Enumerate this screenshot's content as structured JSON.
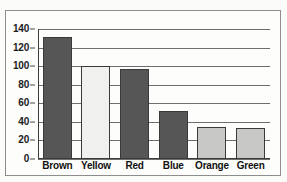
{
  "chart_data": {
    "type": "bar",
    "title": "",
    "subtitle": "",
    "xlabel": "",
    "ylabel": "",
    "categories": [
      "Brown",
      "Yellow",
      "Red",
      "Blue",
      "Orange",
      "Green"
    ],
    "values": [
      131,
      100,
      97,
      52,
      35,
      33
    ],
    "ylim": [
      0,
      140
    ],
    "yticks": [
      0,
      20,
      40,
      60,
      80,
      100,
      120,
      140
    ],
    "ytick_labels": [
      "0",
      "20",
      "40",
      "60",
      "80",
      "100",
      "120",
      "140"
    ],
    "grid": true,
    "legend": false,
    "legend_position": "none",
    "bar_colors": [
      "#565656",
      "#f0f0ee",
      "#565656",
      "#565656",
      "#c8c8c6",
      "#c8c8c6"
    ],
    "bar_edge_color": "#3a3a3a",
    "bars": [
      {
        "category": "Brown",
        "value": 131,
        "fill": "#565656"
      },
      {
        "category": "Yellow",
        "value": 100,
        "fill": "#f0f0ee"
      },
      {
        "category": "Red",
        "value": 97,
        "fill": "#565656"
      },
      {
        "category": "Blue",
        "value": 52,
        "fill": "#565656"
      },
      {
        "category": "Orange",
        "value": 35,
        "fill": "#c8c8c6"
      },
      {
        "category": "Green",
        "value": 33,
        "fill": "#c8c8c6"
      }
    ]
  },
  "style": {
    "page_background": "#fbfbf9",
    "plot_background": "#fdfdfb",
    "frame_color": "#8d8d8d",
    "gridline_color": "#6e6e6e",
    "axis_color": "#3d3d3d",
    "text_color": "#121212"
  }
}
